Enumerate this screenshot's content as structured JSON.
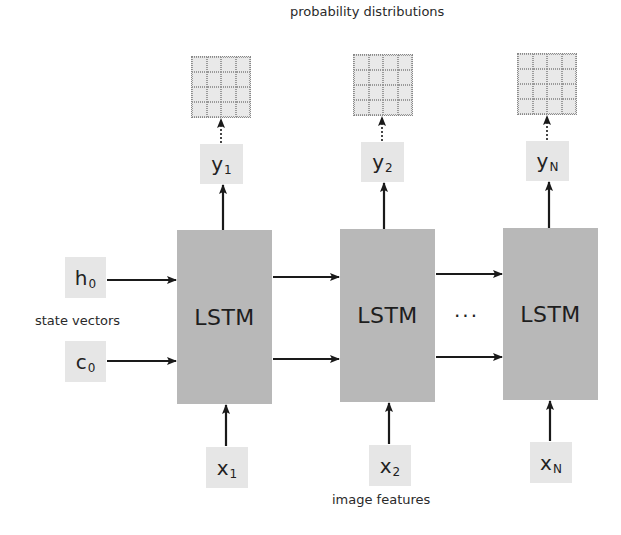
{
  "diagram": {
    "type": "LSTM unrolled sequence model",
    "labels": {
      "top": "probability distributions",
      "left": "state vectors",
      "bottom": "image features",
      "ellipsis": "···"
    },
    "cells": [
      {
        "label": "LSTM"
      },
      {
        "label": "LSTM"
      },
      {
        "label": "LSTM"
      }
    ],
    "outputs": [
      {
        "base": "y",
        "sub": "1"
      },
      {
        "base": "y",
        "sub": "2"
      },
      {
        "base": "y",
        "sub": "N"
      }
    ],
    "inputs": [
      {
        "base": "x",
        "sub": "1"
      },
      {
        "base": "x",
        "sub": "2"
      },
      {
        "base": "x",
        "sub": "N"
      }
    ],
    "initial_states": [
      {
        "base": "h",
        "sub": "0"
      },
      {
        "base": "c",
        "sub": "0"
      }
    ],
    "distribution_grid": {
      "rows": 4,
      "cols": 4,
      "count": 3
    },
    "colors": {
      "cell_fill": "#b8b8b8",
      "var_fill": "#e6e6e6",
      "grid_fill": "#e9e9e9",
      "arrow": "#1a1a1a"
    }
  }
}
